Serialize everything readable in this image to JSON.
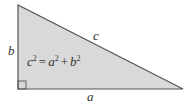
{
  "diagram": {
    "type": "right-triangle",
    "fill_color": "#d9d9d9",
    "stroke_color": "#555555",
    "labels": {
      "vertical_side": "b",
      "hypotenuse": "c",
      "horizontal_side": "a"
    },
    "formula": {
      "c": "c",
      "a": "a",
      "b": "b",
      "exp": "2",
      "eq": "=",
      "plus": "+"
    },
    "right_angle_marker": true
  }
}
